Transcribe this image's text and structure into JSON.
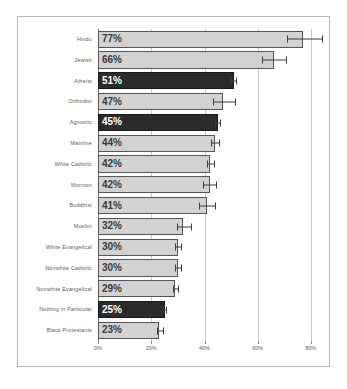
{
  "chart_data": {
    "type": "bar",
    "orientation": "horizontal",
    "title": "",
    "subtitle": "",
    "xlabel": "",
    "ylabel": "",
    "xlim": [
      0,
      87.5
    ],
    "xticks": [
      0,
      20,
      40,
      60,
      80
    ],
    "xticklabels": [
      "0%",
      "20%",
      "40%",
      "60%",
      "80%"
    ],
    "grid": true,
    "grid_axis": "x",
    "legend": null,
    "value_label_suffix": "%",
    "categories": [
      "Hindu",
      "Jewish",
      "Atheist",
      "Orthodox",
      "Agnostic",
      "Mainline",
      "White Catholic",
      "Mormon",
      "Buddhist",
      "Muslim",
      "White Evangelical",
      "Nonwhite Catholic",
      "Nonwhite Evangelical",
      "Nothing in Particular",
      "Black Protestants"
    ],
    "values": [
      77,
      66,
      51,
      47,
      45,
      44,
      42,
      42,
      41,
      32,
      30,
      30,
      29,
      25,
      23
    ],
    "value_labels": [
      "77%",
      "66%",
      "51%",
      "47%",
      "45%",
      "44%",
      "42%",
      "42%",
      "41%",
      "32%",
      "30%",
      "30%",
      "29%",
      "25%",
      "23%"
    ],
    "highlighted": [
      false,
      false,
      true,
      false,
      true,
      false,
      false,
      false,
      false,
      false,
      false,
      false,
      false,
      true,
      false
    ],
    "error_low": [
      71.0,
      61.5,
      50.0,
      43.0,
      44.0,
      42.5,
      41.0,
      39.5,
      38.0,
      29.5,
      29.0,
      29.0,
      28.0,
      24.5,
      22.0
    ],
    "error_high": [
      84.0,
      70.5,
      52.0,
      51.5,
      46.0,
      45.5,
      43.5,
      44.5,
      44.0,
      35.0,
      31.0,
      31.0,
      30.0,
      25.5,
      24.5
    ],
    "colors": {
      "bar_light": "#d2d2d2",
      "bar_dark": "#2b2b2b",
      "bar_outline": "#555555",
      "error_bar": "#3c3c3c",
      "gridline": "#c9c9c9",
      "axis": "#6e6e6e",
      "label_text": "#5b5b5b",
      "value_text_light_bar": "#3a3a3a",
      "value_text_dark_bar": "#ffffff",
      "frame": "#b8b8b8",
      "background": "#ffffff"
    }
  }
}
